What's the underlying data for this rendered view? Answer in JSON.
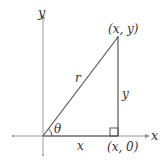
{
  "diagram": {
    "axes": {
      "x_label": "x",
      "y_label": "y"
    },
    "triangle": {
      "hypotenuse_label": "r",
      "adjacent_label": "x",
      "opposite_label": "y",
      "angle_label": "θ",
      "point_label": "(x, y)",
      "foot_label": "(x, 0)"
    },
    "colors": {
      "axis": "#999999",
      "triangle": "#555555",
      "text": "#333333"
    }
  }
}
